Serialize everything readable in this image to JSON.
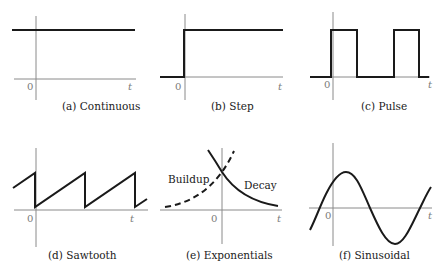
{
  "panels": [
    {
      "id": "a",
      "caption": "(a) Continuous",
      "origin_label": "0",
      "axis_label": "t",
      "description": "constant signal, nonzero for all t"
    },
    {
      "id": "b",
      "caption": "(b) Step",
      "origin_label": "0",
      "axis_label": "t",
      "description": "zero for t<0, jumps to constant at t=0"
    },
    {
      "id": "c",
      "caption": "(c) Pulse",
      "origin_label": "0",
      "axis_label": "t",
      "description": "periodic rectangular pulses starting at t=0"
    },
    {
      "id": "d",
      "caption": "(d) Sawtooth",
      "origin_label": "0",
      "axis_label": "t",
      "description": "linear ramps that drop back to zero periodically"
    },
    {
      "id": "e",
      "caption": "(e) Exponentials",
      "origin_label": "0",
      "axis_label": "t",
      "labels": {
        "buildup": "Buildup",
        "decay": "Decay"
      },
      "description": "dashed growing exponential (buildup) and solid decaying exponential (decay) meeting at t=0"
    },
    {
      "id": "f",
      "caption": "(f) Sinusoidal",
      "origin_label": "0",
      "axis_label": "t",
      "description": "one full sine cycle with phase offset"
    }
  ]
}
